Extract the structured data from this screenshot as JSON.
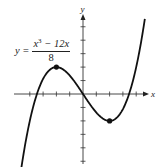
{
  "chart_data": {
    "type": "line",
    "title": "",
    "equation": {
      "lhs": "y =",
      "numerator_base": "x",
      "numerator_exp": "3",
      "numerator_rest": " − 12x",
      "denominator": "8"
    },
    "xlabel": "x",
    "ylabel": "y",
    "xlim": [
      -5,
      5
    ],
    "ylim": [
      -5,
      5
    ],
    "x_ticks": [
      -4,
      -3,
      -2,
      -1,
      1,
      2,
      3,
      4
    ],
    "y_ticks": [
      -5,
      -4,
      -3,
      -2,
      -1,
      1,
      2,
      3,
      4,
      5
    ],
    "tick_labels_shown": false,
    "grid": false,
    "series": [
      {
        "name": "y = (x^3 - 12x)/8",
        "x": [
          -4.6,
          -4,
          -3.5,
          -3,
          -2.5,
          -2,
          -1.5,
          -1,
          -0.5,
          0,
          0.5,
          1,
          1.5,
          2,
          2.5,
          3,
          3.5,
          4,
          4.6
        ],
        "y": [
          -5.27,
          -2.0,
          -0.11,
          1.13,
          1.8,
          2.0,
          1.83,
          1.38,
          0.73,
          0,
          -0.73,
          -1.38,
          -1.83,
          -2.0,
          -1.8,
          -1.13,
          0.11,
          2.0,
          5.27
        ]
      }
    ],
    "marked_points": [
      {
        "label": "local maximum",
        "x": -2,
        "y": 2
      },
      {
        "label": "local minimum",
        "x": 2,
        "y": -2
      }
    ]
  }
}
